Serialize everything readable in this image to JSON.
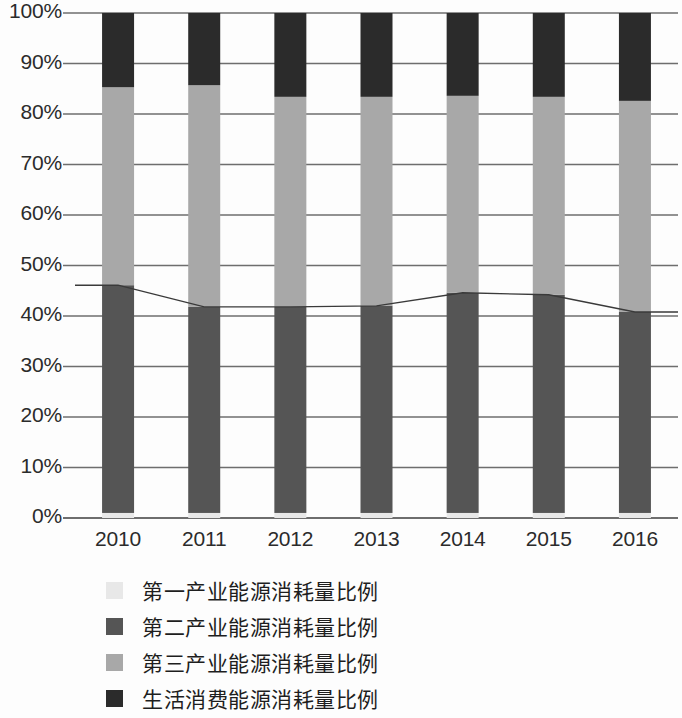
{
  "chart_data": {
    "type": "bar",
    "stacked": true,
    "title": "",
    "xlabel": "",
    "ylabel": "",
    "categories": [
      "2010",
      "2011",
      "2012",
      "2013",
      "2014",
      "2015",
      "2016"
    ],
    "ylim": [
      0,
      100
    ],
    "yticks": [
      "0%",
      "10%",
      "20%",
      "30%",
      "40%",
      "50%",
      "60%",
      "70%",
      "80%",
      "90%",
      "100%"
    ],
    "ytick_values": [
      0,
      10,
      20,
      30,
      40,
      50,
      60,
      70,
      80,
      90,
      100
    ],
    "grid": true,
    "legend_position": "bottom",
    "series": [
      {
        "name": "第一产业能源消耗量比例",
        "color": "#e8e8e8",
        "values": [
          1.0,
          1.0,
          1.0,
          1.0,
          1.0,
          1.0,
          1.0
        ]
      },
      {
        "name": "第二产业能源消耗量比例",
        "color": "#555555",
        "values": [
          45.1,
          40.8,
          40.8,
          41.0,
          43.6,
          43.2,
          39.8
        ]
      },
      {
        "name": "第三产业能源消耗量比例",
        "color": "#a8a8a8",
        "values": [
          39.2,
          43.9,
          41.6,
          41.4,
          39.0,
          39.2,
          41.8
        ]
      },
      {
        "name": "生活消费能源消耗量比例",
        "color": "#2b2b2b",
        "values": [
          14.7,
          14.3,
          16.6,
          16.6,
          16.4,
          16.6,
          17.4
        ]
      }
    ],
    "overlay_line": {
      "name": "第二产业累计比例",
      "color": "#3a3a3a",
      "values": [
        46.1,
        41.8,
        41.8,
        42.0,
        44.6,
        44.2,
        40.8
      ]
    },
    "colors": {
      "primary_industry": "#e8e8e8",
      "secondary_industry": "#555555",
      "tertiary_industry": "#a8a8a8",
      "residential": "#2b2b2b",
      "gridline": "#6e6e6e",
      "axis": "#4a4a4a",
      "text": "#2b2b2b",
      "background": "#fdfdfd"
    }
  },
  "legend": {
    "items": [
      {
        "label": "第一产业能源消耗量比例",
        "color": "#e8e8e8"
      },
      {
        "label": "第二产业能源消耗量比例",
        "color": "#555555"
      },
      {
        "label": "第三产业能源消耗量比例",
        "color": "#a8a8a8"
      },
      {
        "label": "生活消费能源消耗量比例",
        "color": "#2b2b2b"
      }
    ]
  }
}
